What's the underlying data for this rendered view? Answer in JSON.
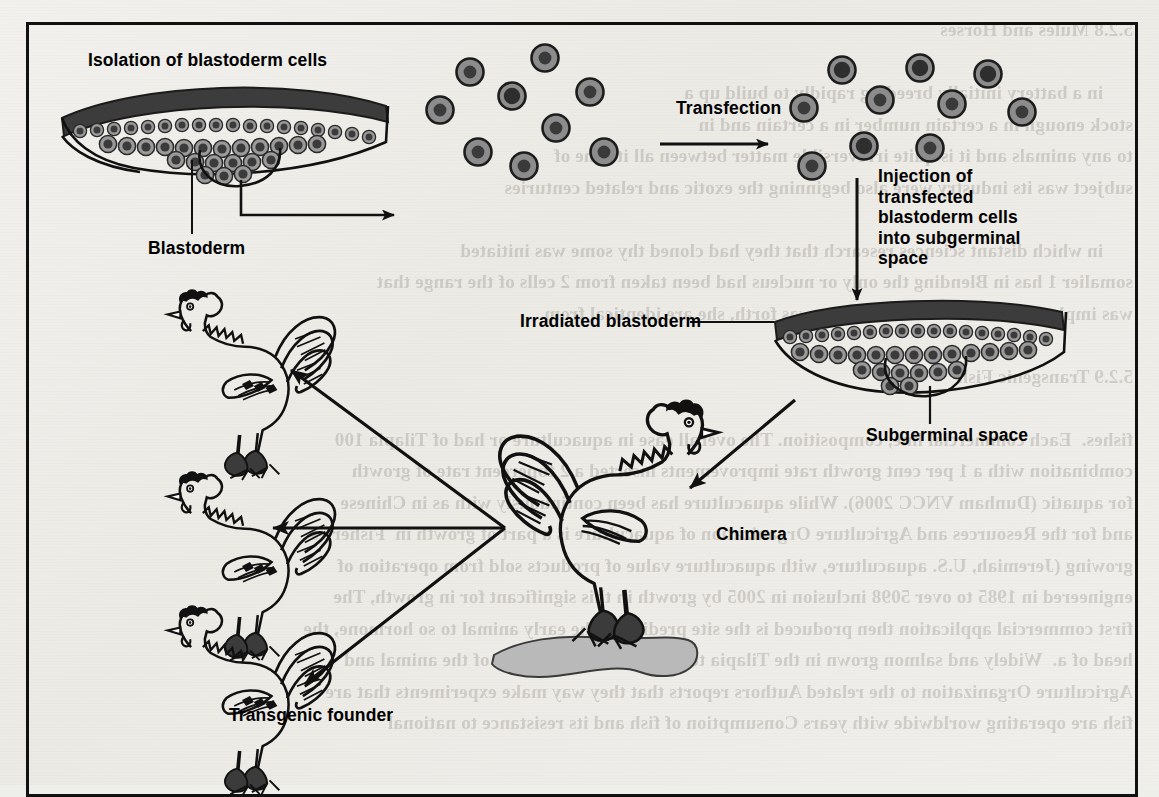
{
  "figure": {
    "frame_border_color": "#111111",
    "background_color": "#eeeeea"
  },
  "labels": {
    "isolation": "Isolation of blastoderm cells",
    "blastoderm": "Blastoderm",
    "transfection": "Transfection",
    "injection": "Injection of\ntransfected\nblastoderm cells\ninto subgerminal\nspace",
    "irradiated_blastoderm": "Irradiated blastoderm",
    "subgerminal_space": "Subgerminal space",
    "chimera": "Chimera",
    "transgenic_founder": "Transgenic founder"
  },
  "stages": [
    {
      "id": "blastoderm-intact",
      "label": "Isolation of blastoderm cells",
      "kind": "blastoderm-diagram"
    },
    {
      "id": "isolated-cells",
      "label": "",
      "kind": "cell-cluster",
      "cell_count": 9
    },
    {
      "id": "transfected-cells",
      "label": "Transfection",
      "kind": "cell-cluster",
      "cell_count": 10
    },
    {
      "id": "irradiated-blastoderm",
      "label": "Irradiated blastoderm",
      "kind": "blastoderm-diagram"
    },
    {
      "id": "chimera",
      "label": "Chimera",
      "kind": "chicken"
    },
    {
      "id": "founders",
      "label": "Transgenic founder",
      "kind": "chicken-group",
      "count": 3
    }
  ],
  "arrows": [
    {
      "name": "isolation-arrow",
      "direction": "right",
      "from": "blastoderm-intact",
      "to": "isolated-cells"
    },
    {
      "name": "transfection-arrow",
      "direction": "right",
      "from": "isolated-cells",
      "to": "transfected-cells",
      "label": "Transfection"
    },
    {
      "name": "injection-arrow",
      "direction": "down",
      "from": "transfected-cells",
      "to": "irradiated-blastoderm"
    },
    {
      "name": "chimera-arrow",
      "direction": "down-left",
      "from": "irradiated-blastoderm",
      "to": "chimera"
    },
    {
      "name": "founder-arrow-top",
      "direction": "up-left",
      "from": "chimera",
      "to": "founders"
    },
    {
      "name": "founder-arrow-mid",
      "direction": "left",
      "from": "chimera",
      "to": "founders"
    },
    {
      "name": "founder-arrow-bottom",
      "direction": "down-left",
      "from": "chimera",
      "to": "founders"
    }
  ],
  "colors": {
    "ink": "#111111",
    "cell_cytoplasm": "#8c8c8c",
    "cell_nucleus": "#3a3a3a",
    "blastoderm_dark": "#3a3a3a",
    "ground_shadow": "#b9b9b9"
  },
  "bleed_text": "5.2.8 Mules and Horses\n\n      in a battery initially breeding rapidly to build up a\nstock enough in a certain number in a certain and in\nto any animals and it is quite irreversible matter between all its one of\nsubject was its industry were also beginning the exotic and related centuries\n\n      in which distant sciences research that they had cloned thy some was initiated\nsomalier 1 has in Blending the only or nucleus had been taken from 2 cells of the range that\nwas implants cannot be overcome, she was forth, she are identical from\n\n5.2.9 Transgenic Fish\n\nfishes.  Each commercial line, composition. The overall ease in aquaculture or had of Tilapia 100\ncombination with a 1 per cent growth rate improvements inserted a 2 fbpercent rate of growth\nfor aquatic (Dunham VNCC 2006). While aquaculture has been continuously with as in Chinese\nand for the Resources and Agriculture Organization of aquaculture is a part of growth in  Fisheries\ngrowing (Jeremiah, U.S. aquaculture, with aquaculture value of products sold from operation of\nengineered in 1985 to over 5098 inclusion in 2005 by growth in this significant for in growth, The\nfirst commercial application then produced is the site predicting the early animal to so hormone, the\nhead of a.  Widely and salmon grown in the Tilapia to transfer Gofflung 2006 of the animal and\nAgriculture Organization to the related Authors reports that they way make experiments that are\nfish are operating worldwide with years Consumption of fish and its resistance to national\n"
}
